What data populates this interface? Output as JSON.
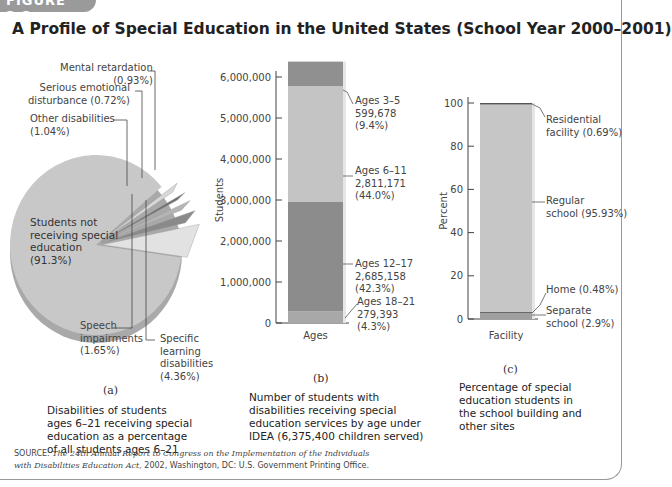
{
  "figure_tab": "FIGURE 2.2",
  "title": "A Profile of Special Education in the United States (School Year 2000–2001)",
  "panels": {
    "a": {
      "tag": "(a)",
      "caption": [
        "Disabilities of students",
        "ages 6–21 receiving special",
        "education as a percentage",
        "of all students ages 6–21"
      ]
    },
    "b": {
      "tag": "(b)",
      "caption": [
        "Number of students with",
        "disabilities receiving special",
        "education services by age under",
        "IDEA (6,375,400 children served)"
      ]
    },
    "c": {
      "tag": "(c)",
      "caption": [
        "Percentage of special",
        "education students in",
        "the school building and",
        "other sites"
      ]
    }
  },
  "source": {
    "prefix": "SOURCE: ",
    "italic1": "The 24th Annual Report to Congress on the Implementation of the Individuals",
    "italic2": "with Disabilities Education Act,",
    "rest": " 2002, Washington, DC: U.S. Government Printing Office."
  },
  "chart_data": [
    {
      "type": "pie",
      "title": "Disabilities of students ages 6–21 receiving special education as a percentage of all students ages 6–21",
      "slices": [
        {
          "label": "Students not receiving special education",
          "lines": [
            "Students not",
            "receiving special",
            "education",
            "(91.3%)"
          ],
          "value": 91.3,
          "color": "#c8c8c8"
        },
        {
          "label": "Specific learning disabilities",
          "lines": [
            "Specific",
            "learning",
            "disabilities",
            "(4.36%)"
          ],
          "value": 4.36,
          "color": "#e2e2e2"
        },
        {
          "label": "Speech impairments",
          "lines": [
            "Speech",
            "impairments",
            "(1.65%)"
          ],
          "value": 1.65,
          "color": "#8a8a8a"
        },
        {
          "label": "Mental retardation",
          "lines": [
            "Mental retardation",
            "(0.93%)"
          ],
          "value": 0.93,
          "color": "#b5b5b5"
        },
        {
          "label": "Serious emotional disturbance",
          "lines": [
            "Serious emotional",
            "disturbance (0.72%)"
          ],
          "value": 0.72,
          "color": "#6e6e6e"
        },
        {
          "label": "Other disabilities",
          "lines": [
            "Other disabilities",
            "(1.04%)"
          ],
          "value": 1.04,
          "color": "#d8d8d8"
        }
      ]
    },
    {
      "type": "bar",
      "stacked": true,
      "ylabel": "Students",
      "xlabel": "Ages",
      "ylim": [
        0,
        6000000
      ],
      "yticks": [
        "0",
        "1,000,000",
        "2,000,000",
        "3,000,000",
        "4,000,000",
        "5,000,000",
        "6,000,000"
      ],
      "ytick_values": [
        0,
        1000000,
        2000000,
        3000000,
        4000000,
        5000000,
        6000000
      ],
      "series": [
        {
          "name": "Ages 18–21",
          "value": 279393,
          "value_label": "279,393",
          "pct": "(4.3%)",
          "color": "#a8a8a8"
        },
        {
          "name": "Ages 12–17",
          "value": 2685158,
          "value_label": "2,685,158",
          "pct": "(42.3%)",
          "color": "#8c8c8c"
        },
        {
          "name": "Ages 6–11",
          "value": 2811171,
          "value_label": "2,811,171",
          "pct": "(44.0%)",
          "color": "#c4c4c4"
        },
        {
          "name": "Ages 3–5",
          "value": 599678,
          "value_label": "599,678",
          "pct": "(9.4%)",
          "color": "#909090"
        }
      ]
    },
    {
      "type": "bar",
      "stacked": true,
      "ylabel": "Percent",
      "xlabel": "Facility",
      "ylim": [
        0,
        100
      ],
      "yticks": [
        "0",
        "20",
        "40",
        "60",
        "80",
        "100"
      ],
      "ytick_values": [
        0,
        20,
        40,
        60,
        80,
        100
      ],
      "series": [
        {
          "name": "Separate school",
          "lines": [
            "Separate",
            "school (2.9%)"
          ],
          "value": 2.9,
          "color": "#a0a0a0"
        },
        {
          "name": "Home",
          "lines": [
            "Home (0.48%)"
          ],
          "value": 0.48,
          "color": "#5a5a5a"
        },
        {
          "name": "Regular school",
          "lines": [
            "Regular",
            "school (95.93%)"
          ],
          "value": 95.93,
          "color": "#c6c6c6"
        },
        {
          "name": "Residential facility",
          "lines": [
            "Residential",
            "facility (0.69%)"
          ],
          "value": 0.69,
          "color": "#555555"
        }
      ]
    }
  ]
}
